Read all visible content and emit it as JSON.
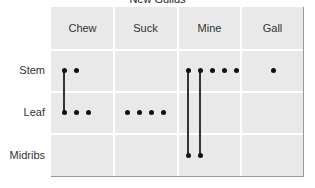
{
  "title": "New Guilds",
  "columns": [
    "Chew",
    "Suck",
    "Mine",
    "Gall"
  ],
  "rows": [
    "Stem",
    "Leaf",
    "Midribs"
  ],
  "colors": {
    "cell_bg": "#e9e9e9",
    "grid_line": "#ffffff",
    "dot": "#111111"
  },
  "cells": {
    "Chew": {
      "Stem": 2,
      "Leaf": 3,
      "Midribs": 0
    },
    "Suck": {
      "Stem": 0,
      "Leaf": 4,
      "Midribs": 0
    },
    "Mine": {
      "Stem": 5,
      "Leaf": 0,
      "Midribs": 2
    },
    "Gall": {
      "Stem": 1,
      "Leaf": 0,
      "Midribs": 0
    }
  },
  "links": [
    {
      "column": "Chew",
      "from": "Stem",
      "to": "Leaf",
      "dot_index": 0
    },
    {
      "column": "Mine",
      "from": "Stem",
      "to": "Midribs",
      "dot_index": 0
    },
    {
      "column": "Mine",
      "from": "Stem",
      "to": "Midribs",
      "dot_index": 1
    }
  ]
}
